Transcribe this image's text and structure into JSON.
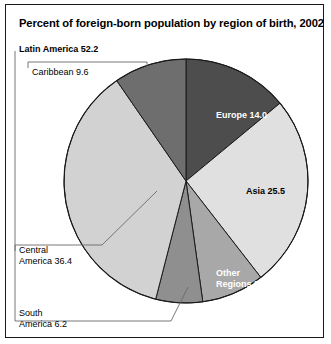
{
  "title": "Percent of foreign-born population by region of birth, 2002",
  "labels": {
    "latin_america": "Latin America 52.2",
    "caribbean": "Caribbean 9.6",
    "central_america_line1": "Central",
    "central_america_line2": "America 36.4",
    "south_america_line1": "South",
    "south_america_line2": "America 6.2",
    "europe": "Europe 14.0",
    "asia": "Asia 25.5",
    "other_line1": "Other",
    "other_line2": "Regions 8.3"
  },
  "colors": {
    "europe": "#4d4d4d",
    "asia": "#e0e0e0",
    "other_regions": "#a8a8a8",
    "south_america": "#8f8f8f",
    "central_america": "#d2d2d2",
    "caribbean": "#6e6e6e",
    "outline": "#1a1a1a",
    "leader": "#555555",
    "text": "#000000",
    "text_inverse": "#ffffff"
  },
  "chart_data": {
    "type": "pie",
    "title": "Percent of foreign-born population by region of birth, 2002",
    "unit": "percent",
    "total": 100.0,
    "legend": "none",
    "labels_inside": [
      "Europe 14.0",
      "Asia 25.5",
      "Other Regions 8.3"
    ],
    "labels_outside": [
      "Latin America 52.2",
      "Caribbean 9.6",
      "Central America 36.4",
      "South America 6.2"
    ],
    "categories": [
      "Europe",
      "Asia",
      "Other Regions",
      "South America",
      "Central America",
      "Caribbean"
    ],
    "values": [
      14.0,
      25.5,
      8.3,
      6.2,
      36.4,
      9.6
    ],
    "groups": [
      {
        "name": "Latin America",
        "value": 52.2,
        "members": [
          "Caribbean",
          "Central America",
          "South America"
        ]
      }
    ],
    "slices": [
      {
        "label": "Europe",
        "value": 14.0,
        "color": "#4d4d4d",
        "start_deg": 0.0,
        "end_deg": 50.4,
        "label_color": "#ffffff",
        "label_position": "inside"
      },
      {
        "label": "Asia",
        "value": 25.5,
        "color": "#e0e0e0",
        "start_deg": 50.4,
        "end_deg": 142.2,
        "label_color": "#000000",
        "label_position": "inside"
      },
      {
        "label": "Other Regions",
        "value": 8.3,
        "color": "#a8a8a8",
        "start_deg": 142.2,
        "end_deg": 172.1,
        "label_color": "#ffffff",
        "label_position": "inside"
      },
      {
        "label": "South America",
        "value": 6.2,
        "color": "#8f8f8f",
        "start_deg": 172.1,
        "end_deg": 194.4,
        "label_color": "#000000",
        "label_position": "outside"
      },
      {
        "label": "Central America",
        "value": 36.4,
        "color": "#d2d2d2",
        "start_deg": 194.4,
        "end_deg": 325.4,
        "label_color": "#000000",
        "label_position": "outside"
      },
      {
        "label": "Caribbean",
        "value": 9.6,
        "color": "#6e6e6e",
        "start_deg": 325.4,
        "end_deg": 360.0,
        "label_color": "#000000",
        "label_position": "outside"
      }
    ]
  }
}
